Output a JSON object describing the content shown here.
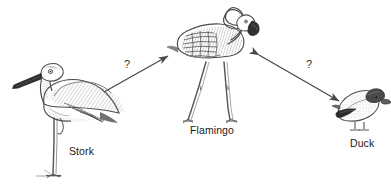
{
  "diagram": {
    "background_color": "#ffffff",
    "ink_color": "#3a3a3a",
    "text_color": "#1a1a1a",
    "nodes": [
      {
        "id": "stork",
        "label": "Stork",
        "icon": "stork-bird-illustration",
        "position": {
          "x": 10,
          "y": 62,
          "width": 110,
          "height": 115
        },
        "label_position": {
          "x": 69,
          "y": 145
        },
        "description": "line-drawing of a stork standing on one leg, dark pointed beak, hatched wing"
      },
      {
        "id": "flamingo",
        "label": "Flamingo",
        "icon": "flamingo-bird-illustration",
        "position": {
          "x": 175,
          "y": 6,
          "width": 95,
          "height": 118
        },
        "label_position": {
          "x": 190,
          "y": 124
        },
        "description": "line-drawing of a flamingo with S-curved neck, dark beak tip, two long splayed legs"
      },
      {
        "id": "duck",
        "label": "Duck",
        "icon": "duck-bird-illustration",
        "position": {
          "x": 330,
          "y": 92,
          "width": 58,
          "height": 45
        },
        "label_position": {
          "x": 350,
          "y": 137
        },
        "description": "line-drawing of a duck with dark head, light body and dark wing patch"
      }
    ],
    "connectors": [
      {
        "id": "stork-flamingo",
        "from": "stork",
        "to": "flamingo",
        "label": "?",
        "arrowheads": "both",
        "label_position": {
          "x": 124,
          "y": 58
        },
        "start": {
          "x": 88,
          "y": 101
        },
        "end": {
          "x": 168,
          "y": 56
        }
      },
      {
        "id": "flamingo-duck",
        "from": "flamingo",
        "to": "duck",
        "label": "?",
        "arrowheads": "both",
        "label_position": {
          "x": 306,
          "y": 58
        },
        "start": {
          "x": 259,
          "y": 55
        },
        "end": {
          "x": 339,
          "y": 101
        }
      }
    ]
  }
}
